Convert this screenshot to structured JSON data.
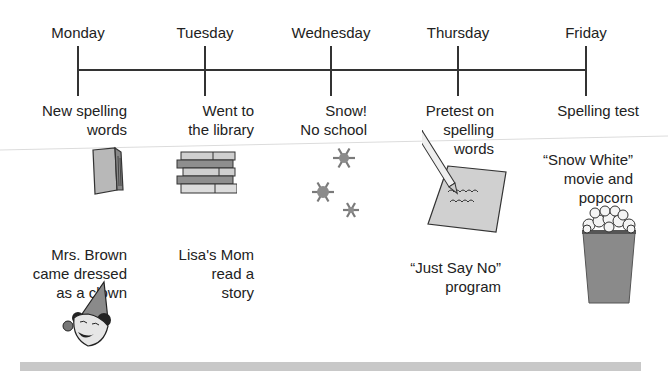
{
  "timeline": {
    "axis_color": "#333333",
    "days": [
      {
        "label": "Monday",
        "x": 78
      },
      {
        "label": "Tuesday",
        "x": 205
      },
      {
        "label": "Wednesday",
        "x": 331
      },
      {
        "label": "Thursday",
        "x": 458
      },
      {
        "label": "Friday",
        "x": 586
      }
    ]
  },
  "events": {
    "monday_1": [
      "New spelling",
      "words"
    ],
    "monday_2": [
      "Mrs. Brown",
      "came dressed",
      "as a clown"
    ],
    "tuesday_1": [
      "Went to",
      "the library"
    ],
    "tuesday_2": [
      "Lisa's Mom",
      "read a",
      "story"
    ],
    "wednesday_1": [
      "Snow!",
      "No school"
    ],
    "thursday_1": [
      "Pretest on",
      "spelling",
      "words"
    ],
    "thursday_2": [
      "“Just Say No”",
      "program"
    ],
    "friday_1": [
      "Spelling test"
    ],
    "friday_2": [
      "“Snow White”",
      "movie and",
      "popcorn"
    ]
  },
  "icons": {
    "monday_1": "book-icon",
    "monday_2": "clown-icon",
    "tuesday_1": "book-stack-icon",
    "wednesday_1": "snowflakes-icon",
    "thursday_1": "pencil-paper-icon",
    "friday_2": "popcorn-icon"
  },
  "colors": {
    "text": "#222222",
    "icon_gray": "#8c8c8c",
    "bar_gray": "#c8c8c8"
  }
}
